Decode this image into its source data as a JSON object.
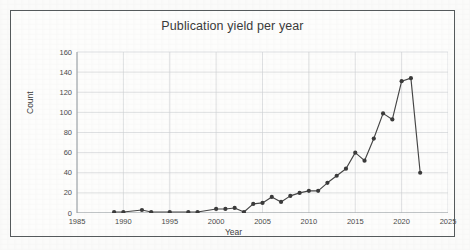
{
  "chart_data": {
    "type": "line",
    "title": "Publication yield per year",
    "xlabel": "Year",
    "ylabel": "Count",
    "xlim": [
      1985,
      2025
    ],
    "ylim": [
      0,
      160
    ],
    "xticks": [
      1985,
      1990,
      1995,
      2000,
      2005,
      2010,
      2015,
      2020,
      2025
    ],
    "yticks": [
      0,
      20,
      40,
      60,
      80,
      100,
      120,
      140,
      160
    ],
    "grid": true,
    "legend": "none",
    "marker": "circle",
    "line_color": "#454545",
    "marker_color": "#3a3a3a",
    "grid_color": "#c9cdd0",
    "x": [
      1989,
      1990,
      1992,
      1993,
      1995,
      1997,
      1998,
      2000,
      2001,
      2002,
      2003,
      2004,
      2005,
      2006,
      2007,
      2008,
      2009,
      2010,
      2011,
      2012,
      2013,
      2014,
      2015,
      2016,
      2017,
      2018,
      2019,
      2020,
      2021,
      2022
    ],
    "values": [
      1,
      1,
      3,
      1,
      1,
      1,
      1,
      4,
      4,
      5,
      1,
      9,
      10,
      16,
      11,
      17,
      20,
      22,
      22,
      30,
      37,
      44,
      60,
      52,
      74,
      99,
      93,
      131,
      134,
      40
    ],
    "series": [
      {
        "name": "Publication count",
        "points": [
          {
            "x": 1989,
            "y": 1
          },
          {
            "x": 1990,
            "y": 1
          },
          {
            "x": 1992,
            "y": 3
          },
          {
            "x": 1993,
            "y": 1
          },
          {
            "x": 1995,
            "y": 1
          },
          {
            "x": 1997,
            "y": 1
          },
          {
            "x": 1998,
            "y": 1
          },
          {
            "x": 2000,
            "y": 4
          },
          {
            "x": 2001,
            "y": 4
          },
          {
            "x": 2002,
            "y": 5
          },
          {
            "x": 2003,
            "y": 1
          },
          {
            "x": 2004,
            "y": 9
          },
          {
            "x": 2005,
            "y": 10
          },
          {
            "x": 2006,
            "y": 16
          },
          {
            "x": 2007,
            "y": 11
          },
          {
            "x": 2008,
            "y": 17
          },
          {
            "x": 2009,
            "y": 20
          },
          {
            "x": 2010,
            "y": 22
          },
          {
            "x": 2011,
            "y": 22
          },
          {
            "x": 2012,
            "y": 30
          },
          {
            "x": 2013,
            "y": 37
          },
          {
            "x": 2014,
            "y": 44
          },
          {
            "x": 2015,
            "y": 60
          },
          {
            "x": 2016,
            "y": 52
          },
          {
            "x": 2017,
            "y": 74
          },
          {
            "x": 2018,
            "y": 99
          },
          {
            "x": 2019,
            "y": 93
          },
          {
            "x": 2020,
            "y": 131
          },
          {
            "x": 2021,
            "y": 134
          },
          {
            "x": 2022,
            "y": 40
          }
        ]
      }
    ]
  }
}
